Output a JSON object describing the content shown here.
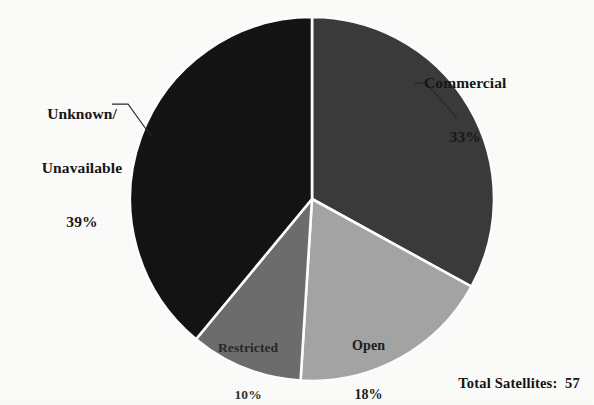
{
  "chart_data": {
    "type": "pie",
    "title": "",
    "categories": [
      "Commercial",
      "Open",
      "Restricted",
      "Unknown/Unavailable"
    ],
    "values": [
      33,
      18,
      10,
      39
    ],
    "value_unit": "percent",
    "labels_formatted": [
      "33%",
      "18%",
      "10%",
      "39%"
    ],
    "slice_colors": [
      "#3b3b3b",
      "#a5a5a5",
      "#6e6e6e",
      "#141414"
    ],
    "start_angle_deg": 0,
    "direction": "clockwise",
    "legend": "none",
    "grid": false,
    "slices": [
      {
        "name": "Commercial",
        "label": "Commercial",
        "percent_text": "33%",
        "value": 33,
        "color": "#3b3b3b",
        "label_placement": "outside-right",
        "leader_line": true
      },
      {
        "name": "Open",
        "label": "Open",
        "percent_text": "18%",
        "value": 18,
        "color": "#a5a5a5",
        "label_placement": "inside",
        "leader_line": false
      },
      {
        "name": "Restricted",
        "label": "Restricted",
        "percent_text": "10%",
        "value": 10,
        "color": "#6e6e6e",
        "label_placement": "inside",
        "leader_line": false
      },
      {
        "name": "Unknown/Unavailable",
        "label_line_1": "Unknown/",
        "label_line_2": "Unavailable",
        "percent_text": "39%",
        "value": 39,
        "color": "#141414",
        "label_placement": "outside-left",
        "leader_line": true
      }
    ],
    "footnote": "Total Satellites:  57"
  },
  "footer": {
    "total_satellites_text": "Total Satellites:  57"
  },
  "geometry": {
    "center_x": 312,
    "center_y": 199,
    "radius": 182
  },
  "colors": {
    "background": "#fdfdfc",
    "separator": "#ffffff",
    "text": "#171717"
  }
}
